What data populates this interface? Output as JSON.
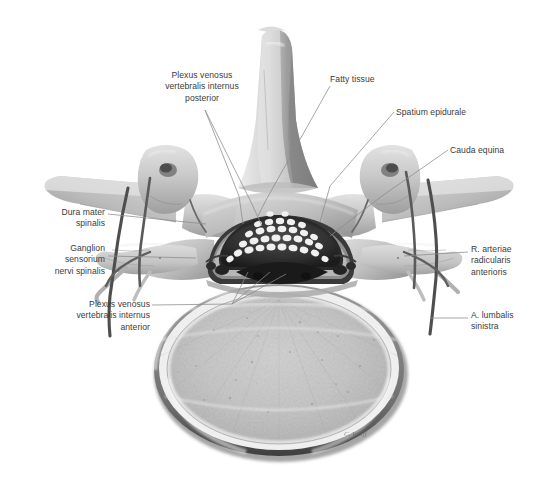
{
  "figure": {
    "type": "anatomical-illustration",
    "style": "grayscale medical illustration",
    "background_color": "#ffffff",
    "label_color": "#3b3b3b",
    "leader_line_color": "#8a8a8a",
    "signature": "C. Wolff"
  },
  "labels": [
    {
      "id": "plexus-venosus-posterior",
      "text": "Plexus venosus\nvertebralis internus\nposterior",
      "align": "center",
      "x": 142,
      "y": 70,
      "width": 120
    },
    {
      "id": "fatty-tissue",
      "text": "Fatty tissue",
      "align": "left",
      "x": 330,
      "y": 74,
      "width": 90
    },
    {
      "id": "spatium-epidurale",
      "text": "Spatium epidurale",
      "align": "left",
      "x": 396,
      "y": 107,
      "width": 110
    },
    {
      "id": "cauda-equina",
      "text": "Cauda equina",
      "align": "left",
      "x": 450,
      "y": 145,
      "width": 95
    },
    {
      "id": "dura-mater-spinalis",
      "text": "Dura mater\nspinalis",
      "align": "right",
      "x": 20,
      "y": 207,
      "width": 85
    },
    {
      "id": "ganglion-sensorium",
      "text": "Ganglion\nsensorium\nnervi spinalis",
      "align": "right",
      "x": 18,
      "y": 243,
      "width": 87
    },
    {
      "id": "r-arteriae-radicularis",
      "text": "R. arteriae\nradicularis\nanterioris",
      "align": "left",
      "x": 471,
      "y": 244,
      "width": 80
    },
    {
      "id": "plexus-venosus-anterior",
      "text": "Plexus venosus\nvertebralis internus\nanterior",
      "align": "right",
      "x": 28,
      "y": 299,
      "width": 122
    },
    {
      "id": "a-lumbalis-sinistra",
      "text": "A. lumbalis\nsinistra",
      "align": "left",
      "x": 471,
      "y": 310,
      "width": 80
    }
  ],
  "structures": [
    {
      "id": "spinous-process",
      "name": "Processus spinosus"
    },
    {
      "id": "vertebral-body",
      "name": "Corpus vertebrae"
    },
    {
      "id": "transverse-process-left",
      "name": "Processus transversus sinister"
    },
    {
      "id": "transverse-process-right",
      "name": "Processus transversus dexter"
    },
    {
      "id": "vertebral-canal",
      "name": "Canalis vertebralis"
    },
    {
      "id": "dural-sac",
      "name": "Saccus duralis"
    },
    {
      "id": "nerve-roots",
      "name": "Radices nervorum (cauda equina)"
    },
    {
      "id": "epidural-fat",
      "name": "Textus adiposus epiduralis"
    },
    {
      "id": "spinal-ganglion-left",
      "name": "Ganglion spinale sinistrum"
    },
    {
      "id": "spinal-ganglion-right",
      "name": "Ganglion spinale dextrum"
    }
  ]
}
